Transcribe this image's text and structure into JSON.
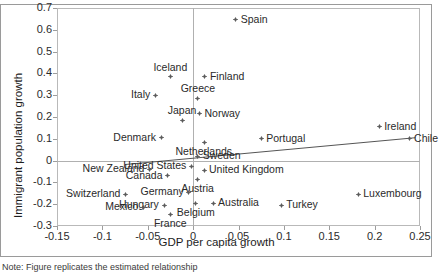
{
  "chart_data": {
    "type": "scatter",
    "title": "",
    "xlabel": "GDP per capita growth",
    "ylabel": "Immigrant population growth",
    "xlim": [
      -0.15,
      0.25
    ],
    "ylim": [
      -0.3,
      0.7
    ],
    "xticks": [
      "-0.15",
      "-0.1",
      "-0.05",
      "0",
      "0.05",
      "0.1",
      "0.15",
      "0.2",
      "0.25"
    ],
    "xtick_values": [
      -0.15,
      -0.1,
      -0.05,
      0,
      0.05,
      0.1,
      0.15,
      0.2,
      0.25
    ],
    "yticks": [
      "0.7",
      "0.6",
      "0.5",
      "0.4",
      "0.3",
      "0.2",
      "0.1",
      "0",
      "-0.1",
      "-0.2",
      "-0.3"
    ],
    "ytick_values": [
      0.7,
      0.6,
      0.5,
      0.4,
      0.3,
      0.2,
      0.1,
      0,
      -0.1,
      -0.2,
      -0.3
    ],
    "grid": false,
    "legend": "none",
    "marker": "small-gray-diamond",
    "trendline": {
      "visible": true,
      "x0": -0.075,
      "y0": -0.018,
      "x1": 0.245,
      "y1": 0.105
    },
    "points": [
      {
        "label": "Spain",
        "x": 0.047,
        "y": 0.645,
        "label_pos": "right"
      },
      {
        "label": "Iceland",
        "x": -0.025,
        "y": 0.385,
        "label_pos": "top"
      },
      {
        "label": "Finland",
        "x": 0.013,
        "y": 0.385,
        "label_pos": "right"
      },
      {
        "label": "Italy",
        "x": -0.042,
        "y": 0.3,
        "label_pos": "left"
      },
      {
        "label": "Greece",
        "x": 0.005,
        "y": 0.285,
        "label_pos": "top"
      },
      {
        "label": "Norway",
        "x": 0.007,
        "y": 0.215,
        "label_pos": "right"
      },
      {
        "label": "Japan",
        "x": -0.012,
        "y": 0.185,
        "label_pos": "top"
      },
      {
        "label": "Ireland",
        "x": 0.205,
        "y": 0.155,
        "label_pos": "right"
      },
      {
        "label": "Denmark",
        "x": -0.035,
        "y": 0.105,
        "label_pos": "left"
      },
      {
        "label": "Portugal",
        "x": 0.075,
        "y": 0.1,
        "label_pos": "right"
      },
      {
        "label": "Chile",
        "x": 0.238,
        "y": 0.1,
        "label_pos": "right"
      },
      {
        "label": "Netherlands",
        "x": 0.012,
        "y": 0.085,
        "label_pos": "bottom"
      },
      {
        "label": "Sweden",
        "x": 0.005,
        "y": 0.02,
        "label_pos": "right"
      },
      {
        "label": "United States",
        "x": -0.002,
        "y": -0.025,
        "label_pos": "left"
      },
      {
        "label": "New Zealand",
        "x": -0.048,
        "y": -0.04,
        "label_pos": "left"
      },
      {
        "label": "United Kingdom",
        "x": 0.012,
        "y": -0.045,
        "label_pos": "right"
      },
      {
        "label": "Canada",
        "x": -0.028,
        "y": -0.07,
        "label_pos": "left"
      },
      {
        "label": "Austria",
        "x": 0.005,
        "y": -0.085,
        "label_pos": "bottom"
      },
      {
        "label": "Germany",
        "x": -0.005,
        "y": -0.145,
        "label_pos": "left"
      },
      {
        "label": "Switzerland",
        "x": -0.075,
        "y": -0.155,
        "label_pos": "left"
      },
      {
        "label": "Luxembourg",
        "x": 0.182,
        "y": -0.155,
        "label_pos": "right"
      },
      {
        "label": "Belgium",
        "x": 0.003,
        "y": -0.195,
        "label_pos": "bottom"
      },
      {
        "label": "Australia",
        "x": 0.022,
        "y": -0.195,
        "label_pos": "right"
      },
      {
        "label": "Hungary",
        "x": -0.032,
        "y": -0.205,
        "label_pos": "left"
      },
      {
        "label": "Turkey",
        "x": 0.097,
        "y": -0.205,
        "label_pos": "right"
      },
      {
        "label": "Mexico",
        "x": -0.055,
        "y": -0.215,
        "label_pos": "left"
      },
      {
        "label": "France",
        "x": -0.025,
        "y": -0.245,
        "label_pos": "bottom"
      }
    ]
  },
  "axes": {
    "x_title": "GDP per capita growth",
    "y_title": "Immigrant population growth"
  },
  "note": {
    "text": "Note: Figure replicates the estimated relationship"
  },
  "colors": {
    "marker": "#5c5c5c",
    "trendline": "#555555",
    "text": "#2a2a2a",
    "frame": "#9a9a9a",
    "axis": "#b0b0b0"
  }
}
